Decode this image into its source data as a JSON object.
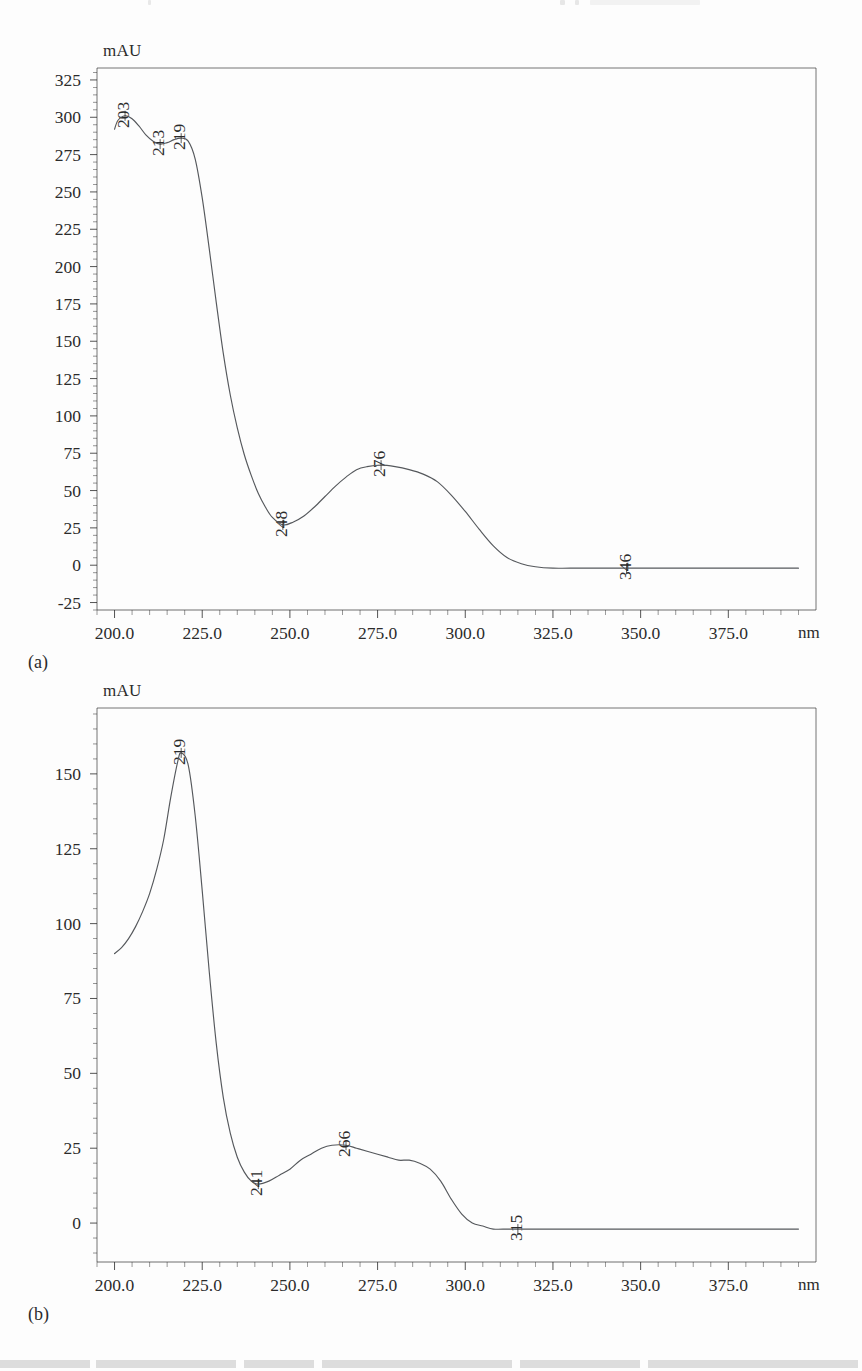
{
  "page": {
    "background_color": "#fdfdfd",
    "ink_color": "#2b2b2b",
    "curve_color": "#55585c"
  },
  "figures": [
    {
      "id": "a",
      "caption": "(a)",
      "y_axis_unit": "mAU",
      "x_axis_unit": "nm",
      "chart_data": {
        "type": "line",
        "title": "",
        "xlabel": "nm",
        "ylabel": "mAU",
        "xlim": [
          195,
          400
        ],
        "ylim": [
          -30,
          333
        ],
        "xticks": [
          200.0,
          225.0,
          250.0,
          275.0,
          300.0,
          325.0,
          350.0,
          375.0
        ],
        "xtick_labels": [
          "200.0",
          "225.0",
          "250.0",
          "275.0",
          "300.0",
          "325.0",
          "350.0",
          "375.0"
        ],
        "yticks": [
          325,
          300,
          275,
          250,
          225,
          200,
          175,
          150,
          125,
          100,
          75,
          50,
          25,
          0,
          -25
        ],
        "ytick_labels": [
          "325",
          "300",
          "275",
          "250",
          "225",
          "200",
          "175",
          "150",
          "125",
          "100",
          "75",
          "50",
          "25",
          "0",
          "-25"
        ],
        "minor_tick_count": 5,
        "grid": false,
        "legend": "none",
        "series": [
          {
            "name": "UV spectrum (a)",
            "x": [
              200,
              201,
              203,
              205,
              207,
              209,
              211,
              213,
              215,
              217,
              219,
              221,
              223,
              225,
              227,
              229,
              231,
              233,
              235,
              237,
              239,
              241,
              243,
              245,
              248,
              251,
              254,
              257,
              260,
              263,
              266,
              269,
              272,
              276,
              280,
              284,
              288,
              292,
              296,
              300,
              304,
              308,
              312,
              316,
              320,
              325,
              330,
              340,
              346,
              360,
              375,
              395
            ],
            "y": [
              292,
              298,
              301,
              299,
              294,
              288,
              284,
              282,
              283,
              285,
              286,
              284,
              272,
              246,
              212,
              176,
              142,
              114,
              92,
              74,
              60,
              48,
              39,
              32,
              27,
              29,
              33,
              39,
              46,
              53,
              59,
              64,
              66,
              67,
              66,
              64,
              61,
              56,
              47,
              36,
              24,
              13,
              5,
              1,
              -1,
              -2,
              -2,
              -2,
              -2,
              -2,
              -2,
              -2
            ]
          }
        ],
        "annotations": [
          {
            "label": "203",
            "x": 203,
            "y": 301,
            "rotation": -90
          },
          {
            "label": "213",
            "x": 213,
            "y": 282,
            "rotation": -90
          },
          {
            "label": "219",
            "x": 219,
            "y": 286,
            "rotation": -90
          },
          {
            "label": "248",
            "x": 248,
            "y": 27,
            "rotation": -90
          },
          {
            "label": "276",
            "x": 276,
            "y": 67,
            "rotation": -90
          },
          {
            "label": "346",
            "x": 346,
            "y": -2,
            "rotation": -90
          }
        ]
      }
    },
    {
      "id": "b",
      "caption": "(b)",
      "y_axis_unit": "mAU",
      "x_axis_unit": "nm",
      "chart_data": {
        "type": "line",
        "title": "",
        "xlabel": "nm",
        "ylabel": "mAU",
        "xlim": [
          195,
          400
        ],
        "ylim": [
          -13,
          172
        ],
        "xticks": [
          200.0,
          225.0,
          250.0,
          275.0,
          300.0,
          325.0,
          350.0,
          375.0
        ],
        "xtick_labels": [
          "200.0",
          "225.0",
          "250.0",
          "275.0",
          "300.0",
          "325.0",
          "350.0",
          "375.0"
        ],
        "yticks": [
          150,
          125,
          100,
          75,
          50,
          25,
          0
        ],
        "ytick_labels": [
          "150",
          "125",
          "100",
          "75",
          "50",
          "25",
          "0"
        ],
        "minor_tick_count": 5,
        "grid": false,
        "legend": "none",
        "series": [
          {
            "name": "UV spectrum (b)",
            "x": [
              200,
              202,
              204,
              206,
              208,
              210,
              212,
              214,
              216,
              218,
              219,
              221,
              223,
              225,
              227,
              229,
              231,
              233,
              235,
              237,
              239,
              241,
              244,
              247,
              250,
              253,
              256,
              259,
              262,
              266,
              269,
              272,
              275,
              278,
              281,
              284,
              287,
              290,
              293,
              296,
              299,
              302,
              305,
              308,
              312,
              315,
              325,
              340,
              360,
              375,
              395
            ],
            "y": [
              90,
              92,
              95,
              99,
              104,
              110,
              118,
              128,
              142,
              154,
              157,
              153,
              136,
              111,
              84,
              60,
              42,
              30,
              22,
              17,
              14,
              13,
              14,
              16,
              18,
              21,
              23,
              25,
              26,
              26,
              25,
              24,
              23,
              22,
              21,
              21,
              20,
              18,
              14,
              8,
              3,
              0,
              -1,
              -2,
              -2,
              -2,
              -2,
              -2,
              -2,
              -2,
              -2
            ]
          }
        ],
        "annotations": [
          {
            "label": "219",
            "x": 219,
            "y": 157,
            "rotation": -90
          },
          {
            "label": "241",
            "x": 241,
            "y": 13,
            "rotation": -90
          },
          {
            "label": "266",
            "x": 266,
            "y": 26,
            "rotation": -90
          },
          {
            "label": "315",
            "x": 315,
            "y": -2,
            "rotation": -90
          }
        ]
      }
    }
  ]
}
